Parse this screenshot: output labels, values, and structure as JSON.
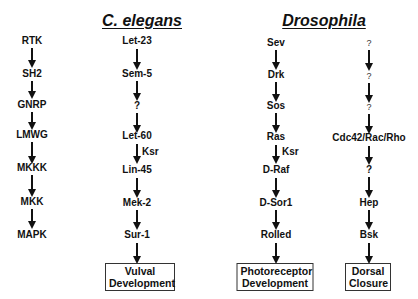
{
  "titles": {
    "celegans": "C. elegans",
    "drosophila": "Drosophila"
  },
  "columns": {
    "generic": [
      "RTK",
      "SH2",
      "GNRP",
      "LMWG",
      "MKKK",
      "MKK",
      "MAPK"
    ],
    "celegans": [
      "Let-23",
      "Sem-5",
      "?",
      "Let-60",
      "Lin-45",
      "Mek-2",
      "Sur-1"
    ],
    "drosophila_eye": [
      "Sev",
      "Drk",
      "Sos",
      "Ras",
      "D-Raf",
      "D-Sor1",
      "Rolled"
    ],
    "drosophila_dorsal": [
      "?",
      "?",
      "?",
      "Cdc42/Rac/Rho",
      "?",
      "Hep",
      "Bsk"
    ]
  },
  "side_labels": {
    "celegans_ksr": "Ksr",
    "drosophila_ksr": "Ksr"
  },
  "outcomes": {
    "celegans": {
      "line1": "Vulval",
      "line2": "Development"
    },
    "drosophila_eye": {
      "line1": "Photoreceptor",
      "line2": "Development"
    },
    "drosophila_dorsal": {
      "line1": "Dorsal",
      "line2": "Closure"
    }
  }
}
